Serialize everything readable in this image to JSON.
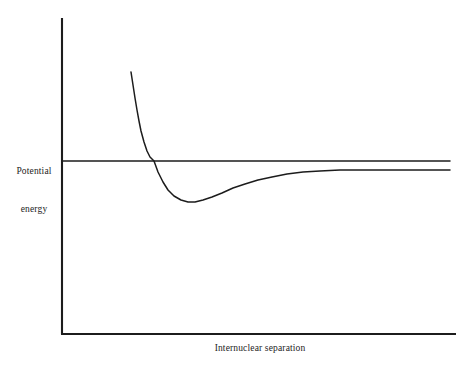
{
  "figure": {
    "background_color": "#ffffff",
    "line_color": "#1c1c1c",
    "text_color": "#1c1c1c"
  },
  "labels": {
    "y_axis_line1": "Potential",
    "y_axis_line2": "energy",
    "x_axis": "Internuclear separation"
  },
  "chart_data": {
    "type": "line",
    "title": "",
    "xlabel": "Internuclear separation",
    "ylabel": "Potential energy",
    "grid": false,
    "legend": null,
    "xticks": [],
    "yticks": [],
    "xlim": [
      0,
      1
    ],
    "ylim": [
      0,
      1
    ],
    "annotations": [],
    "series": [
      {
        "name": "Potential energy curve",
        "description": "Morse-type interatomic potential: steep repulsive rise at small separation, minimum (equilibrium bond length) then gradual approach to the dissociation asymptote from below",
        "color": "#1c1c1c",
        "points": [
          [
            131,
            72
          ],
          [
            133,
            85
          ],
          [
            135,
            98
          ],
          [
            137,
            110
          ],
          [
            139,
            121
          ],
          [
            141,
            131
          ],
          [
            144,
            142
          ],
          [
            147,
            151
          ],
          [
            150,
            157
          ],
          [
            154,
            161
          ],
          [
            158,
            172
          ],
          [
            163,
            182
          ],
          [
            168,
            190
          ],
          [
            174,
            196
          ],
          [
            181,
            200
          ],
          [
            188,
            202
          ],
          [
            195,
            202
          ],
          [
            203,
            200
          ],
          [
            212,
            197
          ],
          [
            222,
            193
          ],
          [
            233,
            188
          ],
          [
            245,
            184
          ],
          [
            258,
            180
          ],
          [
            272,
            177
          ],
          [
            287,
            174
          ],
          [
            303,
            172
          ],
          [
            320,
            171
          ],
          [
            340,
            170
          ],
          [
            365,
            170
          ],
          [
            395,
            170
          ],
          [
            425,
            170
          ],
          [
            450,
            170
          ]
        ]
      },
      {
        "name": "Dissociation reference line",
        "description": "Horizontal zero-energy reference line drawn from the vertical axis across the plot",
        "color": "#1c1c1c",
        "points": [
          [
            62,
            161
          ],
          [
            450,
            161
          ]
        ]
      }
    ],
    "axes": {
      "y_axis": {
        "x": 62,
        "y_top": 18,
        "y_bottom": 334
      },
      "x_axis": {
        "y": 334,
        "x_left": 62,
        "x_right": 456
      }
    }
  }
}
